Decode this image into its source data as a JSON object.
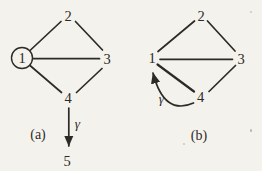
{
  "figure": {
    "background_color": "#f4f2ec",
    "ink_color": "#2e2b27",
    "panels": [
      {
        "caption": "(a)",
        "nodes": [
          {
            "id": "1",
            "label": "1",
            "circled": true
          },
          {
            "id": "2",
            "label": "2",
            "circled": false
          },
          {
            "id": "3",
            "label": "3",
            "circled": false
          },
          {
            "id": "4",
            "label": "4",
            "circled": false
          },
          {
            "id": "5",
            "label": "5",
            "circled": false
          }
        ],
        "edges": [
          "1-2",
          "2-3",
          "1-3",
          "1-4",
          "3-4"
        ],
        "directed_edge": {
          "from": "4",
          "to": "5",
          "label": "γ",
          "style": "straight-down"
        }
      },
      {
        "caption": "(b)",
        "nodes": [
          {
            "id": "1",
            "label": "1",
            "circled": false
          },
          {
            "id": "2",
            "label": "2",
            "circled": false
          },
          {
            "id": "3",
            "label": "3",
            "circled": false
          },
          {
            "id": "4",
            "label": "4",
            "circled": false
          }
        ],
        "edges": [
          "1-2",
          "2-3",
          "1-3",
          "1-4",
          "3-4"
        ],
        "directed_edge": {
          "from": "4",
          "to": "1",
          "label": "γ",
          "style": "curved-left"
        }
      }
    ]
  }
}
